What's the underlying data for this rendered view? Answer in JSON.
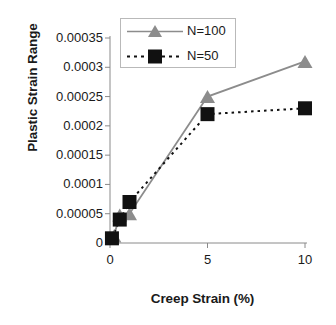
{
  "chart_data": {
    "type": "line",
    "title": "",
    "xlabel": "Creep Strain (%)",
    "ylabel": "Plastic Strain Range",
    "xlim": [
      0,
      10
    ],
    "ylim": [
      0,
      0.00035
    ],
    "xticks": [
      "0",
      "5",
      "10"
    ],
    "xtick_values": [
      0,
      5,
      10
    ],
    "yticks": [
      "0",
      "0.00005",
      "0.0001",
      "0.00015",
      "0.0002",
      "0.00025",
      "0.0003",
      "0.00035"
    ],
    "ytick_values": [
      0,
      5e-05,
      0.0001,
      0.00015,
      0.0002,
      0.00025,
      0.0003,
      0.00035
    ],
    "grid": false,
    "legend_position": "top-center",
    "series": [
      {
        "name": "N=100",
        "marker": "triangle",
        "color": "#8c8c8c",
        "linestyle": "solid",
        "x": [
          0.2,
          0.5,
          1.0,
          5.0,
          10.0
        ],
        "values": [
          1.2e-05,
          4.8e-05,
          5e-05,
          0.00025,
          0.00031
        ]
      },
      {
        "name": "N=50",
        "marker": "square",
        "color": "#111111",
        "linestyle": "dashed",
        "x": [
          0.1,
          0.5,
          1.0,
          5.0,
          10.0
        ],
        "values": [
          8e-06,
          4e-05,
          7e-05,
          0.00022,
          0.00023
        ]
      }
    ]
  },
  "legend": {
    "items": [
      {
        "label": "N=100"
      },
      {
        "label": "N=50"
      }
    ]
  },
  "axes": {
    "x_axis_label": "Creep Strain (%)",
    "y_axis_label": "Plastic Strain Range"
  }
}
